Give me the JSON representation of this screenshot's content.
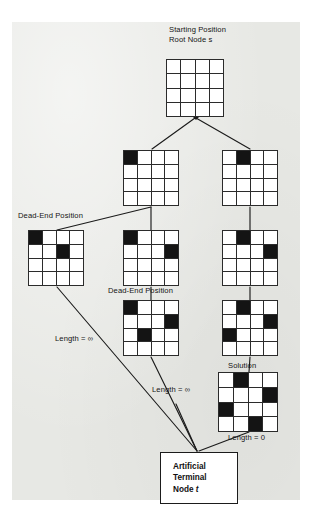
{
  "figure": {
    "title_labels": {
      "root": {
        "line1": "Starting Position",
        "line2_prefix": "Root Node ",
        "line2_italic": "s"
      },
      "dead_end_left": "Dead-End Position",
      "dead_end_middle": "Dead-End Position",
      "solution": "Solution"
    },
    "terminal_node": {
      "line1": "Artificial",
      "line2": "Terminal",
      "line3_prefix": "Node ",
      "line3_italic": "t"
    },
    "edge_labels": [
      {
        "id": "len-inf-left",
        "text": "Length = ∞",
        "x": 55,
        "y": 338
      },
      {
        "id": "len-inf-middle",
        "text": "Length = ∞",
        "x": 152,
        "y": 389
      },
      {
        "id": "len-zero-right",
        "text": "Length = 0",
        "x": 228,
        "y": 437
      }
    ],
    "colors": {
      "paper": "#e7e8e4",
      "ink": "#141414",
      "cell_empty": "#ffffff",
      "cell_queen": "#141414",
      "page": "#ffffff"
    },
    "boards": [
      {
        "id": "root",
        "name": "root-board",
        "x": 166,
        "y": 59,
        "size": 58,
        "queens": [],
        "grid": [
          [
            0,
            0,
            0,
            0
          ],
          [
            0,
            0,
            0,
            0
          ],
          [
            0,
            0,
            0,
            0
          ],
          [
            0,
            0,
            0,
            0
          ]
        ]
      },
      {
        "id": "l2-left",
        "name": "level2-left-board",
        "x": 123,
        "y": 150,
        "size": 56,
        "queens": [
          [
            0,
            0
          ]
        ],
        "grid": [
          [
            1,
            0,
            0,
            0
          ],
          [
            0,
            0,
            0,
            0
          ],
          [
            0,
            0,
            0,
            0
          ],
          [
            0,
            0,
            0,
            0
          ]
        ]
      },
      {
        "id": "l2-right",
        "name": "level2-right-board",
        "x": 222,
        "y": 150,
        "size": 56,
        "queens": [
          [
            0,
            1
          ]
        ],
        "grid": [
          [
            0,
            1,
            0,
            0
          ],
          [
            0,
            0,
            0,
            0
          ],
          [
            0,
            0,
            0,
            0
          ],
          [
            0,
            0,
            0,
            0
          ]
        ]
      },
      {
        "id": "l3-left",
        "name": "dead-end-left-board",
        "x": 28,
        "y": 230,
        "size": 56,
        "queens": [
          [
            0,
            0
          ],
          [
            1,
            2
          ]
        ],
        "grid": [
          [
            1,
            0,
            0,
            0
          ],
          [
            0,
            0,
            1,
            0
          ],
          [
            0,
            0,
            0,
            0
          ],
          [
            0,
            0,
            0,
            0
          ]
        ]
      },
      {
        "id": "l3-mid",
        "name": "level3-middle-board",
        "x": 123,
        "y": 230,
        "size": 56,
        "queens": [
          [
            0,
            0
          ],
          [
            1,
            3
          ]
        ],
        "grid": [
          [
            1,
            0,
            0,
            0
          ],
          [
            0,
            0,
            0,
            1
          ],
          [
            0,
            0,
            0,
            0
          ],
          [
            0,
            0,
            0,
            0
          ]
        ]
      },
      {
        "id": "l3-right",
        "name": "level3-right-board",
        "x": 222,
        "y": 230,
        "size": 56,
        "queens": [
          [
            0,
            1
          ],
          [
            1,
            3
          ]
        ],
        "grid": [
          [
            0,
            1,
            0,
            0
          ],
          [
            0,
            0,
            0,
            1
          ],
          [
            0,
            0,
            0,
            0
          ],
          [
            0,
            0,
            0,
            0
          ]
        ]
      },
      {
        "id": "l4-mid",
        "name": "dead-end-middle-board",
        "x": 123,
        "y": 300,
        "size": 56,
        "queens": [
          [
            0,
            0
          ],
          [
            1,
            3
          ],
          [
            2,
            1
          ]
        ],
        "grid": [
          [
            1,
            0,
            0,
            0
          ],
          [
            0,
            0,
            0,
            1
          ],
          [
            0,
            1,
            0,
            0
          ],
          [
            0,
            0,
            0,
            0
          ]
        ]
      },
      {
        "id": "l4-right",
        "name": "level4-right-board",
        "x": 222,
        "y": 300,
        "size": 56,
        "queens": [
          [
            0,
            1
          ],
          [
            1,
            3
          ],
          [
            2,
            0
          ]
        ],
        "grid": [
          [
            0,
            1,
            0,
            0
          ],
          [
            0,
            0,
            0,
            1
          ],
          [
            1,
            0,
            0,
            0
          ],
          [
            0,
            0,
            0,
            0
          ]
        ]
      },
      {
        "id": "solution",
        "name": "solution-board",
        "x": 218,
        "y": 372,
        "size": 60,
        "queens": [
          [
            0,
            1
          ],
          [
            1,
            3
          ],
          [
            2,
            0
          ],
          [
            3,
            2
          ]
        ],
        "grid": [
          [
            0,
            1,
            0,
            0
          ],
          [
            0,
            0,
            0,
            1
          ],
          [
            1,
            0,
            0,
            0
          ],
          [
            0,
            0,
            1,
            0
          ]
        ]
      }
    ],
    "label_positions": {
      "root_title": {
        "x": 169,
        "y": 26
      },
      "dead_end_left": {
        "x": 18,
        "y": 212
      },
      "dead_end_middle": {
        "x": 108,
        "y": 287
      },
      "solution": {
        "x": 228,
        "y": 362
      }
    },
    "terminal_box": {
      "x": 160,
      "y": 452,
      "width": 78,
      "height": 52
    }
  }
}
